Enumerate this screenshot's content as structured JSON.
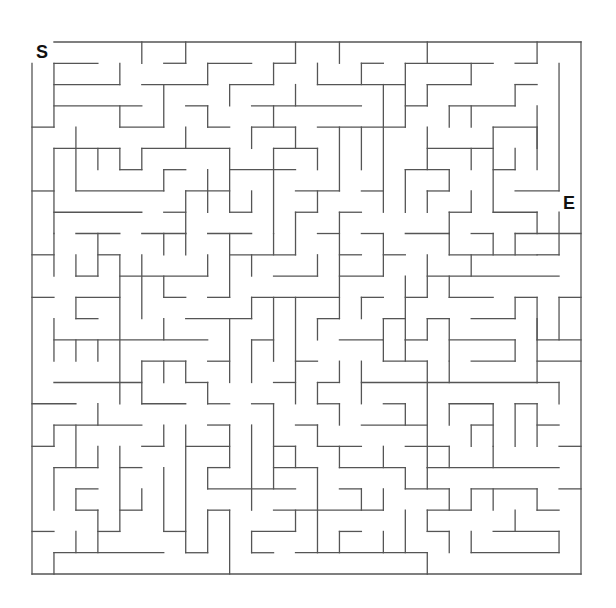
{
  "maze": {
    "start_label": "S",
    "end_label": "E",
    "cols": 25,
    "rows": 25,
    "origin": [
      32,
      42
    ],
    "cell_size": [
      21.96,
      21.28
    ],
    "wall_color": "#555555",
    "wall_width": 1.3,
    "border": {
      "top": [
        1,
        25
      ],
      "bottom": [
        0,
        25
      ],
      "left": [
        1,
        25
      ],
      "right": [
        0,
        25
      ]
    },
    "horizontal_walls": [
      [
        1,
        1,
        3
      ],
      [
        1,
        6,
        7
      ],
      [
        1,
        8,
        10
      ],
      [
        1,
        11,
        12
      ],
      [
        1,
        15,
        16
      ],
      [
        1,
        17,
        21
      ],
      [
        1,
        22,
        23
      ],
      [
        2,
        1,
        4
      ],
      [
        2,
        5,
        8
      ],
      [
        2,
        9,
        11
      ],
      [
        2,
        13,
        17
      ],
      [
        2,
        18,
        20
      ],
      [
        2,
        22,
        23
      ],
      [
        3,
        1,
        5
      ],
      [
        3,
        7,
        8
      ],
      [
        3,
        10,
        15
      ],
      [
        3,
        17,
        18
      ],
      [
        3,
        19,
        22
      ],
      [
        4,
        0,
        1
      ],
      [
        4,
        4,
        6
      ],
      [
        4,
        8,
        9
      ],
      [
        4,
        10,
        12
      ],
      [
        4,
        13,
        17
      ],
      [
        4,
        21,
        23
      ],
      [
        5,
        1,
        4
      ],
      [
        5,
        5,
        9
      ],
      [
        5,
        11,
        13
      ],
      [
        5,
        18,
        21
      ],
      [
        6,
        4,
        5
      ],
      [
        6,
        6,
        7
      ],
      [
        6,
        9,
        12
      ],
      [
        6,
        17,
        19
      ],
      [
        6,
        21,
        22
      ],
      [
        7,
        0,
        1
      ],
      [
        7,
        2,
        6
      ],
      [
        7,
        7,
        9
      ],
      [
        7,
        12,
        14
      ],
      [
        7,
        15,
        16
      ],
      [
        7,
        18,
        19
      ],
      [
        7,
        22,
        24
      ],
      [
        8,
        1,
        5
      ],
      [
        8,
        6,
        7
      ],
      [
        8,
        9,
        10
      ],
      [
        8,
        12,
        13
      ],
      [
        8,
        14,
        15
      ],
      [
        8,
        19,
        20
      ],
      [
        8,
        21,
        23
      ],
      [
        9,
        2,
        4
      ],
      [
        9,
        5,
        7
      ],
      [
        9,
        8,
        10
      ],
      [
        9,
        13,
        14
      ],
      [
        9,
        15,
        16
      ],
      [
        9,
        17,
        19
      ],
      [
        9,
        20,
        21
      ],
      [
        9,
        22,
        25
      ],
      [
        10,
        0,
        1
      ],
      [
        10,
        3,
        4
      ],
      [
        10,
        9,
        12
      ],
      [
        10,
        14,
        15
      ],
      [
        10,
        16,
        17
      ],
      [
        10,
        19,
        23
      ],
      [
        10,
        23,
        24
      ],
      [
        11,
        2,
        3
      ],
      [
        11,
        4,
        8
      ],
      [
        11,
        11,
        13
      ],
      [
        11,
        14,
        16
      ],
      [
        11,
        18,
        24
      ],
      [
        12,
        0,
        1
      ],
      [
        12,
        2,
        4
      ],
      [
        12,
        6,
        7
      ],
      [
        12,
        8,
        9
      ],
      [
        12,
        10,
        14
      ],
      [
        12,
        15,
        16
      ],
      [
        12,
        17,
        18
      ],
      [
        12,
        19,
        21
      ],
      [
        12,
        22,
        23
      ],
      [
        12,
        24,
        25
      ],
      [
        13,
        2,
        3
      ],
      [
        13,
        7,
        10
      ],
      [
        13,
        13,
        14
      ],
      [
        13,
        16,
        17
      ],
      [
        13,
        18,
        19
      ],
      [
        13,
        20,
        22
      ],
      [
        14,
        1,
        8
      ],
      [
        14,
        10,
        11
      ],
      [
        14,
        14,
        16
      ],
      [
        14,
        17,
        18
      ],
      [
        14,
        19,
        22
      ],
      [
        14,
        23,
        25
      ],
      [
        15,
        5,
        7
      ],
      [
        15,
        8,
        9
      ],
      [
        15,
        12,
        13
      ],
      [
        15,
        16,
        18
      ],
      [
        15,
        20,
        22
      ],
      [
        15,
        23,
        25
      ],
      [
        16,
        1,
        5
      ],
      [
        16,
        7,
        8
      ],
      [
        16,
        11,
        12
      ],
      [
        16,
        13,
        14
      ],
      [
        16,
        15,
        23
      ],
      [
        16,
        23,
        24
      ],
      [
        17,
        0,
        2
      ],
      [
        17,
        5,
        7
      ],
      [
        17,
        8,
        9
      ],
      [
        17,
        10,
        11
      ],
      [
        17,
        13,
        14
      ],
      [
        17,
        16,
        17
      ],
      [
        17,
        19,
        21
      ],
      [
        17,
        22,
        23
      ],
      [
        18,
        1,
        5
      ],
      [
        18,
        8,
        9
      ],
      [
        18,
        12,
        13
      ],
      [
        18,
        15,
        18
      ],
      [
        18,
        20,
        21
      ],
      [
        18,
        23,
        24
      ],
      [
        19,
        0,
        1
      ],
      [
        19,
        5,
        6
      ],
      [
        19,
        7,
        9
      ],
      [
        19,
        11,
        12
      ],
      [
        19,
        13,
        15
      ],
      [
        19,
        17,
        19
      ],
      [
        19,
        24,
        25
      ],
      [
        20,
        1,
        3
      ],
      [
        20,
        4,
        5
      ],
      [
        20,
        8,
        9
      ],
      [
        20,
        11,
        13
      ],
      [
        20,
        14,
        17
      ],
      [
        20,
        18,
        24
      ],
      [
        21,
        2,
        3
      ],
      [
        21,
        8,
        12
      ],
      [
        21,
        14,
        15
      ],
      [
        21,
        17,
        19
      ],
      [
        21,
        20,
        23
      ],
      [
        21,
        24,
        25
      ],
      [
        22,
        2,
        3
      ],
      [
        22,
        4,
        5
      ],
      [
        22,
        8,
        9
      ],
      [
        22,
        11,
        16
      ],
      [
        22,
        18,
        20
      ],
      [
        22,
        23,
        24
      ],
      [
        23,
        0,
        1
      ],
      [
        23,
        3,
        4
      ],
      [
        23,
        6,
        7
      ],
      [
        23,
        10,
        12
      ],
      [
        23,
        14,
        15
      ],
      [
        23,
        18,
        19
      ],
      [
        23,
        21,
        24
      ],
      [
        24,
        1,
        6
      ],
      [
        24,
        7,
        8
      ],
      [
        24,
        10,
        11
      ],
      [
        24,
        12,
        18
      ],
      [
        24,
        20,
        24
      ]
    ],
    "vertical_walls": [
      [
        1,
        1,
        4
      ],
      [
        1,
        5,
        9
      ],
      [
        1,
        9,
        11
      ],
      [
        1,
        13,
        15
      ],
      [
        1,
        18,
        19
      ],
      [
        1,
        20,
        22
      ],
      [
        1,
        24,
        25
      ],
      [
        2,
        4,
        7
      ],
      [
        2,
        10,
        11
      ],
      [
        2,
        12,
        13
      ],
      [
        2,
        14,
        15
      ],
      [
        2,
        18,
        20
      ],
      [
        2,
        21,
        22
      ],
      [
        2,
        23,
        24
      ],
      [
        3,
        5,
        6
      ],
      [
        3,
        9,
        11
      ],
      [
        3,
        14,
        15
      ],
      [
        3,
        17,
        18
      ],
      [
        3,
        19,
        20
      ],
      [
        3,
        22,
        24
      ],
      [
        4,
        1,
        2
      ],
      [
        4,
        3,
        4
      ],
      [
        4,
        5,
        6
      ],
      [
        4,
        10,
        17
      ],
      [
        4,
        19,
        23
      ],
      [
        5,
        0,
        1
      ],
      [
        5,
        5,
        6
      ],
      [
        5,
        10,
        13
      ],
      [
        5,
        15,
        17
      ],
      [
        5,
        21,
        22
      ],
      [
        6,
        2,
        4
      ],
      [
        6,
        6,
        7
      ],
      [
        6,
        9,
        10
      ],
      [
        6,
        11,
        12
      ],
      [
        6,
        13,
        14
      ],
      [
        6,
        15,
        16
      ],
      [
        6,
        18,
        19
      ],
      [
        6,
        20,
        23
      ],
      [
        7,
        0,
        1
      ],
      [
        7,
        4,
        5
      ],
      [
        7,
        7,
        9
      ],
      [
        7,
        9,
        10
      ],
      [
        7,
        15,
        16
      ],
      [
        7,
        18,
        24
      ],
      [
        8,
        1,
        2
      ],
      [
        8,
        3,
        4
      ],
      [
        8,
        6,
        8
      ],
      [
        8,
        10,
        11
      ],
      [
        8,
        16,
        17
      ],
      [
        8,
        20,
        21
      ],
      [
        8,
        22,
        24
      ],
      [
        9,
        2,
        3
      ],
      [
        9,
        5,
        8
      ],
      [
        9,
        9,
        12
      ],
      [
        9,
        13,
        16
      ],
      [
        9,
        18,
        20
      ],
      [
        9,
        22,
        25
      ],
      [
        10,
        4,
        5
      ],
      [
        10,
        7,
        8
      ],
      [
        10,
        10,
        11
      ],
      [
        10,
        12,
        13
      ],
      [
        10,
        14,
        16
      ],
      [
        10,
        18,
        22
      ],
      [
        10,
        23,
        24
      ],
      [
        11,
        1,
        2
      ],
      [
        11,
        3,
        4
      ],
      [
        11,
        5,
        9
      ],
      [
        11,
        9,
        10
      ],
      [
        11,
        12,
        15
      ],
      [
        11,
        17,
        21
      ],
      [
        12,
        0,
        1
      ],
      [
        12,
        2,
        3
      ],
      [
        12,
        4,
        5
      ],
      [
        12,
        8,
        10
      ],
      [
        12,
        12,
        17
      ],
      [
        12,
        19,
        20
      ],
      [
        12,
        22,
        23
      ],
      [
        13,
        1,
        2
      ],
      [
        13,
        5,
        6
      ],
      [
        13,
        7,
        8
      ],
      [
        13,
        10,
        11
      ],
      [
        13,
        13,
        14
      ],
      [
        13,
        16,
        17
      ],
      [
        13,
        18,
        19
      ],
      [
        13,
        20,
        24
      ],
      [
        14,
        0,
        1
      ],
      [
        14,
        4,
        7
      ],
      [
        14,
        8,
        13
      ],
      [
        14,
        15,
        16
      ],
      [
        14,
        17,
        18
      ],
      [
        14,
        19,
        20
      ],
      [
        14,
        23,
        24
      ],
      [
        15,
        1,
        2
      ],
      [
        15,
        4,
        6
      ],
      [
        15,
        12,
        13
      ],
      [
        15,
        15,
        17
      ],
      [
        15,
        21,
        22
      ],
      [
        16,
        2,
        8
      ],
      [
        16,
        9,
        11
      ],
      [
        16,
        13,
        14
      ],
      [
        16,
        14,
        15
      ],
      [
        16,
        19,
        20
      ],
      [
        16,
        21,
        22
      ],
      [
        16,
        23,
        24
      ],
      [
        17,
        1,
        2
      ],
      [
        17,
        2,
        4
      ],
      [
        17,
        6,
        8
      ],
      [
        17,
        11,
        14
      ],
      [
        17,
        14,
        15
      ],
      [
        17,
        17,
        18
      ],
      [
        17,
        20,
        21
      ],
      [
        17,
        22,
        24
      ],
      [
        18,
        0,
        1
      ],
      [
        18,
        2,
        3
      ],
      [
        18,
        4,
        6
      ],
      [
        18,
        7,
        8
      ],
      [
        18,
        10,
        12
      ],
      [
        18,
        13,
        14
      ],
      [
        18,
        15,
        20
      ],
      [
        18,
        20,
        21
      ],
      [
        18,
        22,
        23
      ],
      [
        18,
        24,
        25
      ],
      [
        19,
        3,
        4
      ],
      [
        19,
        6,
        7
      ],
      [
        19,
        8,
        9
      ],
      [
        19,
        9,
        10
      ],
      [
        19,
        11,
        12
      ],
      [
        19,
        13,
        15
      ],
      [
        19,
        15,
        16
      ],
      [
        19,
        17,
        18
      ],
      [
        19,
        19,
        20
      ],
      [
        19,
        21,
        22
      ],
      [
        19,
        23,
        24
      ],
      [
        20,
        1,
        2
      ],
      [
        20,
        3,
        4
      ],
      [
        20,
        5,
        6
      ],
      [
        20,
        7,
        8
      ],
      [
        20,
        10,
        11
      ],
      [
        20,
        18,
        19
      ],
      [
        20,
        21,
        22
      ],
      [
        20,
        23,
        24
      ],
      [
        21,
        4,
        8
      ],
      [
        21,
        9,
        10
      ],
      [
        21,
        17,
        19
      ],
      [
        21,
        19,
        20
      ],
      [
        21,
        21,
        22
      ],
      [
        22,
        2,
        3
      ],
      [
        22,
        5,
        6
      ],
      [
        22,
        9,
        10
      ],
      [
        22,
        12,
        13
      ],
      [
        22,
        14,
        15
      ],
      [
        22,
        17,
        19
      ],
      [
        22,
        22,
        23
      ],
      [
        23,
        0,
        1
      ],
      [
        23,
        3,
        5
      ],
      [
        23,
        4,
        6
      ],
      [
        23,
        8,
        9
      ],
      [
        23,
        12,
        14
      ],
      [
        23,
        13,
        16
      ],
      [
        23,
        17,
        19
      ],
      [
        23,
        21,
        22
      ],
      [
        24,
        1,
        7
      ],
      [
        24,
        8,
        10
      ],
      [
        24,
        12,
        14
      ],
      [
        24,
        16,
        17
      ],
      [
        24,
        23,
        24
      ]
    ]
  }
}
